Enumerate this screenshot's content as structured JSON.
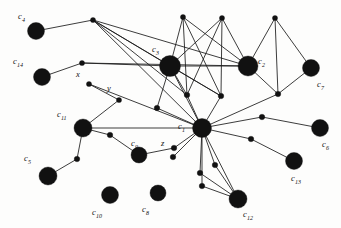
{
  "figure": {
    "width": 341,
    "height": 228,
    "background_color": "#fdfdfc",
    "ink_color": "#111111"
  },
  "chart_data": {
    "type": "scatter",
    "title": "",
    "xlabel": "",
    "ylabel": "",
    "grid": false,
    "legend": null,
    "xlim": [
      0,
      341
    ],
    "ylim": [
      0,
      228
    ],
    "major_nodes": [
      {
        "id": "c4",
        "label": "c4",
        "sub": "4",
        "x": 36,
        "y": 31,
        "r": 8.5,
        "label_x": 18,
        "label_y": 12
      },
      {
        "id": "c14",
        "label": "c14",
        "sub": "14",
        "x": 42,
        "y": 77,
        "r": 8.5,
        "label_x": 13,
        "label_y": 57
      },
      {
        "id": "c3",
        "label": "c3",
        "sub": "3",
        "x": 170,
        "y": 66,
        "r": 10.5,
        "label_x": 152,
        "label_y": 45
      },
      {
        "id": "c2",
        "label": "c2",
        "sub": "2",
        "x": 248,
        "y": 66,
        "r": 10.0,
        "label_x": 258,
        "label_y": 57
      },
      {
        "id": "c7",
        "label": "c7",
        "sub": "7",
        "x": 311,
        "y": 68,
        "r": 8.5,
        "label_x": 317,
        "label_y": 80
      },
      {
        "id": "c11",
        "label": "c11",
        "sub": "11",
        "x": 83,
        "y": 128,
        "r": 9.0,
        "label_x": 57,
        "label_y": 110
      },
      {
        "id": "c1",
        "label": "c1",
        "sub": "1",
        "x": 202,
        "y": 128,
        "r": 9.5,
        "label_x": 178,
        "label_y": 122
      },
      {
        "id": "c9",
        "label": "c9",
        "sub": "9",
        "x": 139,
        "y": 155,
        "r": 8.0,
        "label_x": 131,
        "label_y": 139
      },
      {
        "id": "c6",
        "label": "c6",
        "sub": "6",
        "x": 320,
        "y": 128,
        "r": 8.5,
        "label_x": 322,
        "label_y": 140
      },
      {
        "id": "c5",
        "label": "c5",
        "sub": "5",
        "x": 48,
        "y": 176,
        "r": 9.0,
        "label_x": 24,
        "label_y": 154
      },
      {
        "id": "c13",
        "label": "c13",
        "sub": "13",
        "x": 294,
        "y": 161,
        "r": 8.5,
        "label_x": 291,
        "label_y": 174
      },
      {
        "id": "c12",
        "label": "c12",
        "sub": "12",
        "x": 238,
        "y": 199,
        "r": 9.0,
        "label_x": 243,
        "label_y": 210
      },
      {
        "id": "c10",
        "label": "c10",
        "sub": "10",
        "x": 110,
        "y": 195,
        "r": 8.5,
        "label_x": 92,
        "label_y": 208
      },
      {
        "id": "c8",
        "label": "c8",
        "sub": "8",
        "x": 158,
        "y": 193,
        "r": 8.0,
        "label_x": 142,
        "label_y": 205
      }
    ],
    "minor_nodes": [
      {
        "id": "n1",
        "x": 93,
        "y": 20,
        "r": 2.6
      },
      {
        "id": "n2",
        "x": 183,
        "y": 17,
        "r": 2.6
      },
      {
        "id": "n3",
        "x": 222,
        "y": 18,
        "r": 2.6
      },
      {
        "id": "n4",
        "x": 275,
        "y": 18,
        "r": 2.6
      },
      {
        "id": "n5",
        "x": 82,
        "y": 63,
        "r": 2.6
      },
      {
        "id": "x",
        "x": 89,
        "y": 84,
        "r": 2.6,
        "label": "x",
        "label_x": 76,
        "label_y": 70
      },
      {
        "id": "y",
        "x": 119,
        "y": 100,
        "r": 2.6,
        "label": "y",
        "label_x": 107,
        "label_y": 84
      },
      {
        "id": "n8",
        "x": 187,
        "y": 95,
        "r": 2.8
      },
      {
        "id": "n9",
        "x": 221,
        "y": 96,
        "r": 2.8
      },
      {
        "id": "n10",
        "x": 278,
        "y": 94,
        "r": 2.8
      },
      {
        "id": "n11",
        "x": 157,
        "y": 108,
        "r": 2.8
      },
      {
        "id": "n12",
        "x": 262,
        "y": 117,
        "r": 2.8
      },
      {
        "id": "n13",
        "x": 110,
        "y": 135,
        "r": 2.8
      },
      {
        "id": "n14",
        "x": 251,
        "y": 139,
        "r": 2.8
      },
      {
        "id": "z",
        "x": 174,
        "y": 148,
        "r": 2.8,
        "label": "z",
        "label_x": 161,
        "label_y": 139
      },
      {
        "id": "n16",
        "x": 77,
        "y": 159,
        "r": 2.8
      },
      {
        "id": "n17",
        "x": 173,
        "y": 157,
        "r": 2.8
      },
      {
        "id": "n18",
        "x": 215,
        "y": 165,
        "r": 2.8
      },
      {
        "id": "n19",
        "x": 200,
        "y": 173,
        "r": 2.8
      },
      {
        "id": "n20",
        "x": 202,
        "y": 186,
        "r": 2.8
      }
    ],
    "edges": [
      [
        "c4",
        "n1"
      ],
      [
        "n1",
        "c3"
      ],
      [
        "n1",
        "c2"
      ],
      [
        "n1",
        "n9"
      ],
      [
        "n1",
        "n8"
      ],
      [
        "n1",
        "c1"
      ],
      [
        "c14",
        "n5"
      ],
      [
        "n5",
        "c3"
      ],
      [
        "n5",
        "c2"
      ],
      [
        "x",
        "y"
      ],
      [
        "x",
        "c1"
      ],
      [
        "y",
        "c11"
      ],
      [
        "n2",
        "c3"
      ],
      [
        "n2",
        "n8"
      ],
      [
        "n2",
        "n9"
      ],
      [
        "n2",
        "c2"
      ],
      [
        "n3",
        "c3"
      ],
      [
        "n3",
        "n8"
      ],
      [
        "n3",
        "n9"
      ],
      [
        "n3",
        "c2"
      ],
      [
        "n4",
        "c2"
      ],
      [
        "n4",
        "n10"
      ],
      [
        "n4",
        "c7"
      ],
      [
        "c2",
        "c3"
      ],
      [
        "c2",
        "n10"
      ],
      [
        "c7",
        "n10"
      ],
      [
        "n10",
        "c1"
      ],
      [
        "c3",
        "n8"
      ],
      [
        "c3",
        "n9"
      ],
      [
        "c3",
        "n11"
      ],
      [
        "c3",
        "c1"
      ],
      [
        "n8",
        "c1"
      ],
      [
        "n9",
        "c1"
      ],
      [
        "n11",
        "c1"
      ],
      [
        "c11",
        "c1"
      ],
      [
        "c11",
        "n13"
      ],
      [
        "c11",
        "n16"
      ],
      [
        "n13",
        "c9"
      ],
      [
        "c9",
        "z"
      ],
      [
        "z",
        "c1"
      ],
      [
        "n16",
        "c5"
      ],
      [
        "c1",
        "n12"
      ],
      [
        "n12",
        "c6"
      ],
      [
        "c1",
        "n14"
      ],
      [
        "n14",
        "c13"
      ],
      [
        "c1",
        "n17"
      ],
      [
        "c1",
        "n18"
      ],
      [
        "c1",
        "n19"
      ],
      [
        "c1",
        "n20"
      ],
      [
        "n18",
        "c12"
      ],
      [
        "n19",
        "c12"
      ],
      [
        "n20",
        "c12"
      ],
      [
        "c1",
        "c12"
      ]
    ],
    "isolated_nodes": [
      "c10",
      "c8"
    ]
  }
}
